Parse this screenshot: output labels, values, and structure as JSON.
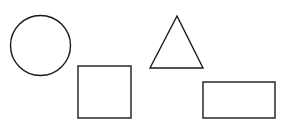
{
  "canvas": {
    "width": 281,
    "height": 133,
    "background": "#ffffff"
  },
  "style": {
    "stroke": "#1a1a1a",
    "stroke_width": 1.4,
    "fill": "#ffffff"
  },
  "shapes": [
    {
      "type": "circle",
      "name": "circle",
      "cx": 40.5,
      "cy": 45.5,
      "r": 30
    },
    {
      "type": "rect",
      "name": "square",
      "x": 78,
      "y": 66,
      "width": 53,
      "height": 52
    },
    {
      "type": "triangle",
      "name": "triangle",
      "points": [
        [
          177,
          16
        ],
        [
          150,
          68
        ],
        [
          203,
          68
        ]
      ]
    },
    {
      "type": "rect",
      "name": "rectangle",
      "x": 203,
      "y": 82,
      "width": 72,
      "height": 36
    }
  ]
}
